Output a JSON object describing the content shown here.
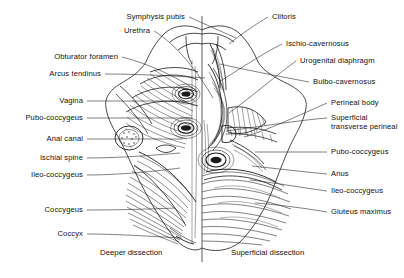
{
  "figure": {
    "title_alt": "Female perineum and pelvic floor dissection",
    "midline_color": "#333333",
    "ink_color": "#1a1a1a",
    "paper_color": "#ffffff"
  },
  "captions": [
    {
      "text": "Deeper dissection",
      "x": 100,
      "y": 248
    },
    {
      "text": "Superficial dissection",
      "x": 231,
      "y": 248
    }
  ],
  "left_labels": [
    {
      "text": "Symphysis pubis",
      "x": 185,
      "y": 13,
      "lx": 189,
      "ly": 17,
      "tx": 236,
      "ty": 38
    },
    {
      "text": "Urethra",
      "x": 150,
      "y": 27,
      "lx": 154,
      "ly": 31,
      "tx": 213,
      "ty": 98
    },
    {
      "text": "Obturator foramen",
      "x": 118,
      "y": 53,
      "lx": 122,
      "ly": 57,
      "tx": 196,
      "ty": 90
    },
    {
      "text": "Arcus tendinus",
      "x": 101,
      "y": 70,
      "lx": 105,
      "ly": 74,
      "tx": 205,
      "ty": 78
    },
    {
      "text": "Vagina",
      "x": 83,
      "y": 97,
      "lx": 87,
      "ly": 101,
      "tx": 185,
      "ty": 101
    },
    {
      "text": "Pubo-coccygeus",
      "x": 83,
      "y": 114,
      "lx": 87,
      "ly": 118,
      "tx": 192,
      "ty": 118
    },
    {
      "text": "Anal canal",
      "x": 83,
      "y": 135,
      "lx": 87,
      "ly": 139,
      "tx": 183,
      "ty": 139
    },
    {
      "text": "Ischial spine",
      "x": 83,
      "y": 154,
      "lx": 87,
      "ly": 158,
      "tx": 180,
      "ty": 153
    },
    {
      "text": "Ileo-coccygeus",
      "x": 83,
      "y": 171,
      "lx": 87,
      "ly": 175,
      "tx": 180,
      "ty": 168
    },
    {
      "text": "Coccygeus",
      "x": 83,
      "y": 206,
      "lx": 87,
      "ly": 210,
      "tx": 175,
      "ty": 208
    },
    {
      "text": "Coccyx",
      "x": 83,
      "y": 230,
      "lx": 87,
      "ly": 234,
      "tx": 182,
      "ty": 238
    }
  ],
  "right_labels": [
    {
      "text": "Clitoris",
      "x": 272,
      "y": 13,
      "lx": 268,
      "ly": 17,
      "tx": 229,
      "ty": 44
    },
    {
      "text": "Ischio-cavernosus",
      "x": 286,
      "y": 40,
      "lx": 282,
      "ly": 44,
      "tx": 219,
      "ty": 82
    },
    {
      "text": "Urogenital diaphragm",
      "x": 300,
      "y": 57,
      "lx": 296,
      "ly": 61,
      "tx": 229,
      "ty": 113
    },
    {
      "text": "Bulbo-cavernosus",
      "x": 313,
      "y": 78,
      "lx": 309,
      "ly": 82,
      "tx": 220,
      "ty": 64
    },
    {
      "text": "Perineal body",
      "x": 331,
      "y": 99,
      "lx": 327,
      "ly": 103,
      "tx": 244,
      "ty": 137
    },
    {
      "text": "Superficial transverse perineal",
      "x": 331,
      "y": 114,
      "lx": 327,
      "ly": 118,
      "tx": 226,
      "ty": 131,
      "multiline": true
    },
    {
      "text": "Pubo-coccygeus",
      "x": 331,
      "y": 148,
      "lx": 327,
      "ly": 152,
      "tx": 255,
      "ty": 152
    },
    {
      "text": "Anus",
      "x": 331,
      "y": 170,
      "lx": 327,
      "ly": 174,
      "tx": 252,
      "ty": 166
    },
    {
      "text": "Ileo-coccygeus",
      "x": 331,
      "y": 187,
      "lx": 327,
      "ly": 191,
      "tx": 250,
      "ty": 180
    },
    {
      "text": "Gluteus maximus",
      "x": 331,
      "y": 208,
      "lx": 327,
      "ly": 212,
      "tx": 255,
      "ty": 203,
      "multiline": true
    }
  ]
}
